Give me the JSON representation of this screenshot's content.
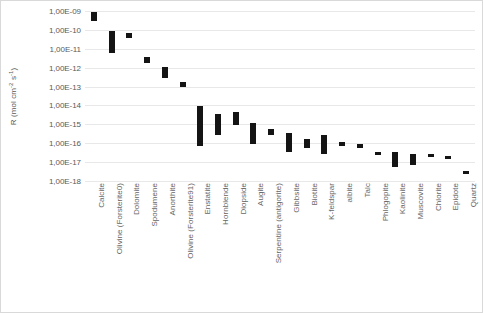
{
  "chart_data": {
    "type": "bar",
    "subtype": "floating-range-bar",
    "title": "",
    "xlabel": "",
    "ylabel": "R (mol cm-2 s-1)",
    "ylabel_parts": {
      "prefix": "R (mol cm",
      "exp1": "-2",
      "mid": " s",
      "exp2": "-1",
      "suffix": ")"
    },
    "yscale": "log",
    "ylim": [
      1e-18,
      1e-09
    ],
    "grid": true,
    "legend": null,
    "ytick_labels": [
      "1,00E-09",
      "1,00E-10",
      "1,00E-11",
      "1,00E-12",
      "1,00E-13",
      "1,00E-14",
      "1,00E-15",
      "1,00E-16",
      "1,00E-17",
      "1,00E-18"
    ],
    "ytick_values": [
      1e-09,
      1e-10,
      1e-11,
      1e-12,
      1e-13,
      1e-14,
      1e-15,
      1e-16,
      1e-17,
      1e-18
    ],
    "categories": [
      "Calcite",
      "Olivine (Forsterite0)",
      "Dolomite",
      "Spodumene",
      "Anorthite",
      "Olivine (Forsterite91)",
      "Enstatite",
      "Hornblende",
      "Diopside",
      "Augite",
      "Serpentine (antigorite)",
      "Gibbsite",
      "Biotite",
      "K-feldspar",
      "albite",
      "Talc",
      "Phlogopite",
      "Kaolinite",
      "Muscovite",
      "Chlorite",
      "Epidote",
      "Quartz"
    ],
    "bar_color": "#141414",
    "ranges": [
      {
        "category": "Calcite",
        "low_exp": -9.55,
        "high_exp": -9.05
      },
      {
        "category": "Olivine (Forsterite0)",
        "low_exp": -11.25,
        "high_exp": -10.05
      },
      {
        "category": "Dolomite",
        "low_exp": -10.45,
        "high_exp": -10.15
      },
      {
        "category": "Spodumene",
        "low_exp": -11.75,
        "high_exp": -11.45
      },
      {
        "category": "Anorthite",
        "low_exp": -12.55,
        "high_exp": -11.95
      },
      {
        "category": "Olivine (Forsterite91)",
        "low_exp": -13.05,
        "high_exp": -12.75
      },
      {
        "category": "Enstatite",
        "low_exp": -16.15,
        "high_exp": -14.05
      },
      {
        "category": "Hornblende",
        "low_exp": -15.55,
        "high_exp": -14.45
      },
      {
        "category": "Diopside",
        "low_exp": -15.05,
        "high_exp": -14.35
      },
      {
        "category": "Augite",
        "low_exp": -16.05,
        "high_exp": -14.95
      },
      {
        "category": "Serpentine (antigorite)",
        "low_exp": -15.55,
        "high_exp": -15.25
      },
      {
        "category": "Gibbsite",
        "low_exp": -16.45,
        "high_exp": -15.45
      },
      {
        "category": "Biotite",
        "low_exp": -16.25,
        "high_exp": -15.75
      },
      {
        "category": "K-feldspar",
        "low_exp": -16.55,
        "high_exp": -15.55
      },
      {
        "category": "albite",
        "low_exp": -16.15,
        "high_exp": -15.95
      },
      {
        "category": "Talc",
        "low_exp": -16.25,
        "high_exp": -16.05
      },
      {
        "category": "Phlogopite",
        "low_exp": -16.65,
        "high_exp": -16.45
      },
      {
        "category": "Kaolinite",
        "low_exp": -17.25,
        "high_exp": -16.45
      },
      {
        "category": "Muscovite",
        "low_exp": -17.15,
        "high_exp": -16.55
      },
      {
        "category": "Chlorite",
        "low_exp": -16.75,
        "high_exp": -16.55
      },
      {
        "category": "Epidote",
        "low_exp": -16.85,
        "high_exp": -16.65
      },
      {
        "category": "Quartz",
        "low_exp": -17.65,
        "high_exp": -17.45
      }
    ]
  }
}
